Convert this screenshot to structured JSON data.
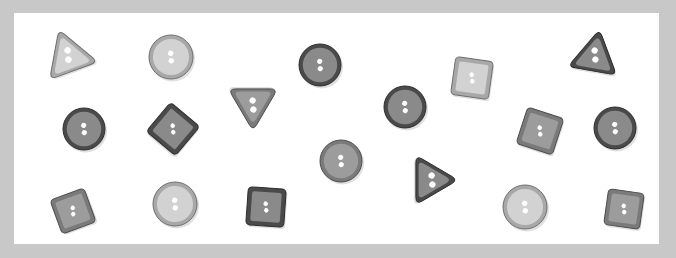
{
  "tones": {
    "light": {
      "fill": "#d2d2d2",
      "inner": "#d8d8d8",
      "rim": "#a8a8a8",
      "edge": "#6e6e6e"
    },
    "medium": {
      "fill": "#9c9c9c",
      "inner": "#a6a6a6",
      "rim": "#7a7a7a",
      "edge": "#4e4e4e"
    },
    "dark": {
      "fill": "#8a8a8a",
      "inner": "#969696",
      "rim": "#4a4a4a",
      "edge": "#2e2e2e"
    }
  },
  "buttons": [
    {
      "shape": "triangle",
      "tone": "light",
      "holes": 2
    },
    {
      "shape": "circle",
      "tone": "light",
      "holes": 2
    },
    {
      "shape": "circle",
      "tone": "dark",
      "holes": 2
    },
    {
      "shape": "triangle",
      "tone": "medium",
      "holes": 2
    },
    {
      "shape": "circle",
      "tone": "dark",
      "holes": 2
    },
    {
      "shape": "square",
      "tone": "light",
      "holes": 2
    },
    {
      "shape": "triangle",
      "tone": "dark",
      "holes": 2
    },
    {
      "shape": "circle",
      "tone": "dark",
      "holes": 2
    },
    {
      "shape": "square",
      "tone": "dark",
      "holes": 2
    },
    {
      "shape": "square",
      "tone": "medium",
      "holes": 2
    },
    {
      "shape": "circle",
      "tone": "dark",
      "holes": 2
    },
    {
      "shape": "circle",
      "tone": "medium",
      "holes": 2
    },
    {
      "shape": "triangle",
      "tone": "dark",
      "holes": 2
    },
    {
      "shape": "square",
      "tone": "medium",
      "holes": 2
    },
    {
      "shape": "circle",
      "tone": "light",
      "holes": 2
    },
    {
      "shape": "square",
      "tone": "dark",
      "holes": 2
    },
    {
      "shape": "circle",
      "tone": "light",
      "holes": 2
    },
    {
      "shape": "square",
      "tone": "medium",
      "holes": 2
    }
  ],
  "counts": {
    "total": 18,
    "circle": 8,
    "square": 6,
    "triangle": 4
  }
}
